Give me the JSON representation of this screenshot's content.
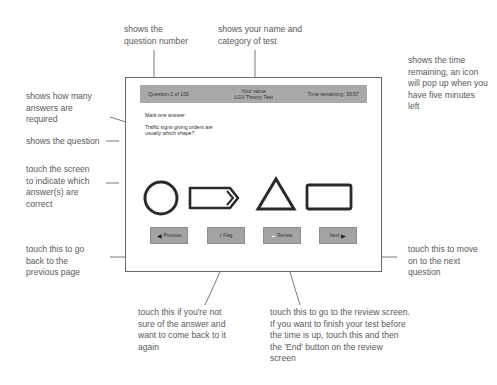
{
  "screen": {
    "header": {
      "question_number": "Question 2 of 100",
      "name": "Your name",
      "test_category": "LGV Theory Test",
      "time_remaining": "Time remaining: 39:57"
    },
    "instruction": "Mark one answer",
    "question": "Traffic signs giving orders are usually which shape?",
    "answers": [
      {
        "shape": "circle"
      },
      {
        "shape": "arrow-rectangle"
      },
      {
        "shape": "triangle"
      },
      {
        "shape": "rectangle"
      }
    ],
    "buttons": {
      "previous": {
        "label": "Previous",
        "icon": "arrow-left-icon"
      },
      "flag": {
        "label": "Flag",
        "icon": "exclamation-icon"
      },
      "review": {
        "label": "Review",
        "icon": "review-icon"
      },
      "next": {
        "label": "Next",
        "icon": "arrow-right-icon"
      }
    }
  },
  "callouts": {
    "question_number": "shows the question number",
    "name_category": "shows your name and category of test",
    "time": "shows the time remaining, an icon will pop up when you have five minutes left",
    "answers_required": "shows how many answers are required",
    "question": "shows the question",
    "touch_screen": "touch the screen to indicate which answer(s) are correct",
    "previous": "touch this to go back to the previous page",
    "next": "touch this to move on to the next question",
    "flag": "touch this if you're not sure of the answer and want to come back to it again",
    "review": "touch this to go to the review screen. If you want to finish your test before the time is up, touch this and then the 'End' button on the review screen"
  }
}
